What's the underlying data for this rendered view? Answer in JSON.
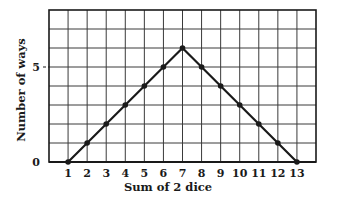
{
  "chart_data": {
    "type": "line",
    "title": "",
    "xlabel": "Sum of 2 dice",
    "ylabel": "Number of ways",
    "x": [
      1,
      2,
      3,
      4,
      5,
      6,
      7,
      8,
      9,
      10,
      11,
      12,
      13
    ],
    "series": [
      {
        "name": "Number of ways",
        "values": [
          0,
          1,
          2,
          3,
          4,
          5,
          6,
          5,
          4,
          3,
          2,
          1,
          0
        ]
      }
    ],
    "x_tick_labels": [
      "1",
      "2",
      "3",
      "4",
      "5",
      "6",
      "7",
      "8",
      "9",
      "10",
      "11",
      "12",
      "13"
    ],
    "y_tick_labels": [
      "0",
      "5"
    ],
    "y_ticks": [
      0,
      5
    ],
    "xlim": [
      0,
      14
    ],
    "ylim": [
      0,
      8
    ],
    "grid": true,
    "legend": null,
    "colors": {
      "line": "#1a1a1a",
      "grid": "#3a3a3a",
      "marker": "#1a1a1a"
    }
  }
}
